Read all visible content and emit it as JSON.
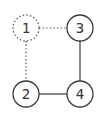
{
  "diagram": {
    "type": "graph",
    "nodes": [
      {
        "id": "1",
        "label": "1",
        "x": 26,
        "y": 28,
        "style": "dotted"
      },
      {
        "id": "2",
        "label": "2",
        "x": 26,
        "y": 94,
        "style": "solid"
      },
      {
        "id": "3",
        "label": "3",
        "x": 80,
        "y": 28,
        "style": "solid"
      },
      {
        "id": "4",
        "label": "4",
        "x": 80,
        "y": 94,
        "style": "solid"
      }
    ],
    "edges": [
      {
        "from": "1",
        "to": "3",
        "style": "dotted"
      },
      {
        "from": "1",
        "to": "2",
        "style": "dotted"
      },
      {
        "from": "3",
        "to": "4",
        "style": "solid"
      },
      {
        "from": "2",
        "to": "4",
        "style": "solid"
      }
    ],
    "node_radius": 13,
    "colors": {
      "stroke": "#3a3a3a",
      "dotted_stroke": "#555555",
      "background": "#ffffff",
      "label": "#333333"
    }
  }
}
